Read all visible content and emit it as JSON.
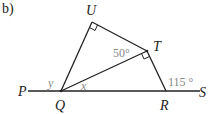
{
  "part_label": "b)",
  "points": {
    "P": {
      "label": "P",
      "x": 16,
      "y": 96
    },
    "Q": {
      "label": "Q",
      "x": 61,
      "y": 91
    },
    "U": {
      "label": "U",
      "x": 92,
      "y": 22
    },
    "T": {
      "label": "T",
      "x": 147,
      "y": 51
    },
    "R": {
      "label": "R",
      "x": 166,
      "y": 91
    },
    "S": {
      "label": "S",
      "x": 200,
      "y": 96
    }
  },
  "angles": {
    "UTQ": "50°",
    "TRS": "115 °",
    "y": "y",
    "x": "x"
  },
  "right_angles": [
    "U",
    "T"
  ],
  "colors": {
    "line": "#222222",
    "angle_text": "#888888"
  }
}
